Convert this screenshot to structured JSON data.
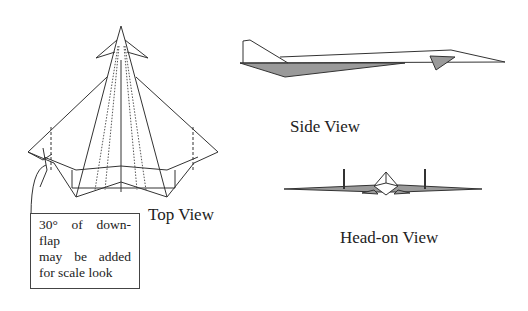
{
  "diagram": {
    "type": "aircraft three-view drawing",
    "views": [
      {
        "id": "top",
        "label": "Top View"
      },
      {
        "id": "side",
        "label": "Side View"
      },
      {
        "id": "head_on",
        "label": "Head-on View"
      }
    ],
    "annotation": {
      "lines": [
        "30° of down-flap",
        "may be added",
        "for scale look"
      ]
    },
    "colors": {
      "line": "#333333",
      "fill_gray": "#9a9a9a",
      "background": "#ffffff"
    }
  }
}
